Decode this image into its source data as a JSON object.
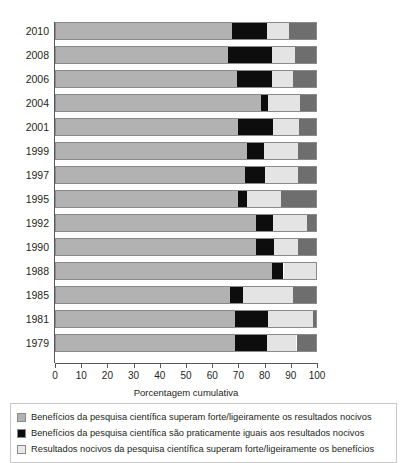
{
  "chart_data": {
    "type": "bar",
    "orientation": "horizontal",
    "stacked": true,
    "title": "",
    "xlabel": "Porcentagem cumulativa",
    "ylabel": "",
    "xlim": [
      0,
      100
    ],
    "xticks": [
      0,
      10,
      20,
      30,
      40,
      50,
      60,
      70,
      80,
      90,
      100
    ],
    "xtick_labels": [
      "0",
      "10",
      "20",
      "30",
      "40",
      "50",
      "60",
      "70",
      "80",
      "90",
      "100"
    ],
    "grid": false,
    "legend_position": "bottom",
    "categories": [
      "2010",
      "2008",
      "2006",
      "2004",
      "2001",
      "1999",
      "1997",
      "1995",
      "1992",
      "1990",
      "1988",
      "1985",
      "1981",
      "1979"
    ],
    "series": [
      {
        "name": "Benefícios da pesquisa científica superam forte/ligeiramente os resultados nocivos",
        "color": "#b2b2b2",
        "values": [
          67.5,
          66,
          69.5,
          79,
          70,
          73.5,
          72.5,
          70,
          77,
          77,
          83,
          67,
          69,
          69
        ]
      },
      {
        "name": "Benefícios da pesquisa científica são praticamente iguais aos resultados nocivos",
        "color": "#0d0d0d",
        "values": [
          13.5,
          17,
          13.5,
          2.5,
          13.5,
          6.5,
          8,
          3.5,
          6.5,
          7,
          4.5,
          5,
          12.5,
          12
        ]
      },
      {
        "name": "Resultados nocivos da pesquisa científica superam forte/ligeiramente os benefícios",
        "color": "#e4e4e4",
        "values": [
          8.5,
          9,
          8,
          12.5,
          10,
          13,
          12.5,
          13,
          13,
          9,
          12.5,
          19,
          17.5,
          11.5
        ]
      },
      {
        "name": "Outros",
        "color": "#6e6e6e",
        "values": [
          10.5,
          8,
          9,
          6,
          6.5,
          7,
          7,
          13.5,
          3.5,
          7,
          0,
          9,
          1,
          7.5
        ]
      }
    ]
  },
  "legend": {
    "items": [
      {
        "swatch": "benefits-swatch",
        "label": "Benefícios da pesquisa científica superam forte/ligeiramente os resultados nocivos"
      },
      {
        "swatch": "equal-swatch",
        "label": "Benefícios da pesquisa científica são praticamente iguais aos resultados nocivos"
      },
      {
        "swatch": "harm-swatch",
        "label": "Resultados nocivos da pesquisa científica superam forte/ligeiramente os benefícios"
      }
    ]
  }
}
